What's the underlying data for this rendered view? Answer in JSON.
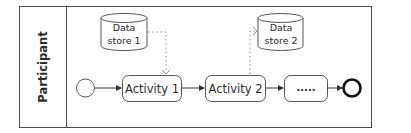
{
  "diagram": {
    "type": "BPMN process",
    "pool": {
      "label": "Participant"
    },
    "data_stores": [
      {
        "id": "ds1",
        "line1": "Data",
        "line2": "store 1"
      },
      {
        "id": "ds2",
        "line1": "Data",
        "line2": "store 2"
      }
    ],
    "events": {
      "start": "start-event",
      "end": "end-event"
    },
    "activities": [
      {
        "id": "a1",
        "label": "Activity 1"
      },
      {
        "id": "a2",
        "label": "Activity 2"
      },
      {
        "id": "a3",
        "label": "....."
      }
    ],
    "flows": [
      {
        "from": "start",
        "to": "a1",
        "style": "solid"
      },
      {
        "from": "a1",
        "to": "a2",
        "style": "solid"
      },
      {
        "from": "a2",
        "to": "a3",
        "style": "solid"
      },
      {
        "from": "a3",
        "to": "end",
        "style": "solid"
      }
    ],
    "associations": [
      {
        "from": "ds1",
        "to": "a1",
        "style": "dotted"
      },
      {
        "from": "a2",
        "to": "ds2",
        "style": "dotted"
      }
    ],
    "colors": {
      "stroke": "#3a3a3a",
      "text": "#2a2a2a",
      "background": "#ffffff"
    }
  }
}
